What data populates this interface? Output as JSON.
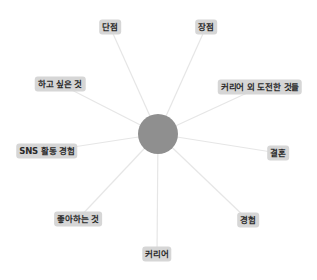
{
  "diagram": {
    "type": "radial-mind-map",
    "colors": {
      "background": "#ffffff",
      "hub_fill": "#8f8f8f",
      "link_stroke": "#e6e6e6",
      "label_background": "#d6d6d6",
      "label_text": "#2a2a2a"
    },
    "hub": {
      "cx": 158,
      "cy": 134,
      "r": 20,
      "label": ""
    },
    "nodes": [
      {
        "id": "weakness",
        "label": "단점",
        "x": 110,
        "y": 27
      },
      {
        "id": "strength",
        "label": "장점",
        "x": 206,
        "y": 27
      },
      {
        "id": "want-to-do",
        "label": "하고 싶은 것",
        "x": 60,
        "y": 84
      },
      {
        "id": "non-career-challenges",
        "label": "커리어 외 도전한 것들",
        "x": 260,
        "y": 87
      },
      {
        "id": "sns-experience",
        "label": "SNS 활동 경험",
        "x": 47,
        "y": 151
      },
      {
        "id": "marriage",
        "label": "결혼",
        "x": 278,
        "y": 153
      },
      {
        "id": "likes",
        "label": "좋아하는 것",
        "x": 78,
        "y": 219
      },
      {
        "id": "experience",
        "label": "경험",
        "x": 248,
        "y": 220
      },
      {
        "id": "career",
        "label": "커리어",
        "x": 157,
        "y": 254
      }
    ]
  }
}
